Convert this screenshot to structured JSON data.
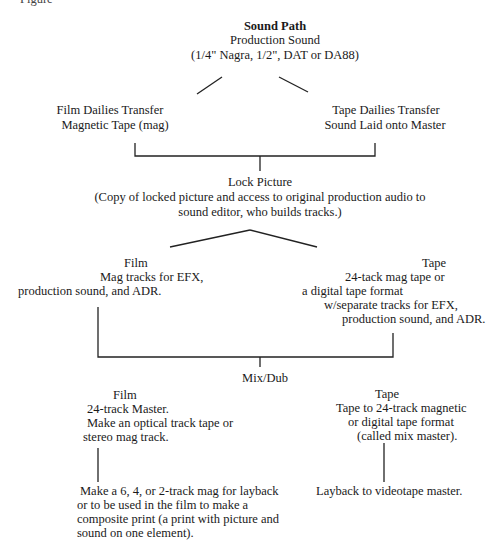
{
  "caption_fragment": "Figure",
  "diagram": {
    "title": "Sound Path",
    "root": {
      "label": "Production Sound",
      "detail": "(1/4\" Nagra, 1/2\", DAT or DA88)"
    },
    "dailies": [
      {
        "line1": "Film Dailies Transfer",
        "line2": "Magnetic Tape (mag)"
      },
      {
        "line1": "Tape Dailies Transfer",
        "line2": "Sound Laid onto Master"
      }
    ],
    "lock_picture": {
      "label": "Lock Picture",
      "detail_line1": "(Copy of locked picture and access to original production audio to",
      "detail_line2": "sound editor, who builds tracks.)"
    },
    "editing": {
      "film": {
        "title": "Film",
        "line1": "Mag tracks for EFX,",
        "line2": "production sound, and ADR."
      },
      "tape": {
        "title": "Tape",
        "line1": "24-tack mag tape or",
        "line2": "a digital tape format",
        "line3": "w/separate tracks for EFX,",
        "line4": "production sound, and ADR."
      }
    },
    "mix": {
      "label": "Mix/Dub",
      "film": {
        "title": "Film",
        "line1": "24-track Master.",
        "line2": "Make an optical track tape or",
        "line3": "stereo mag track."
      },
      "tape": {
        "title": "Tape",
        "line1": "Tape to 24-track magnetic",
        "line2": "or digital tape format",
        "line3": "(called mix master)."
      }
    },
    "output": {
      "film": {
        "line1": "Make a 6, 4, or 2-track mag for layback",
        "line2": "or to be used in the film to make a",
        "line3": "composite print (a print with picture and",
        "line4": "sound on one element)."
      },
      "tape": {
        "line1": "Layback to videotape master."
      }
    }
  }
}
